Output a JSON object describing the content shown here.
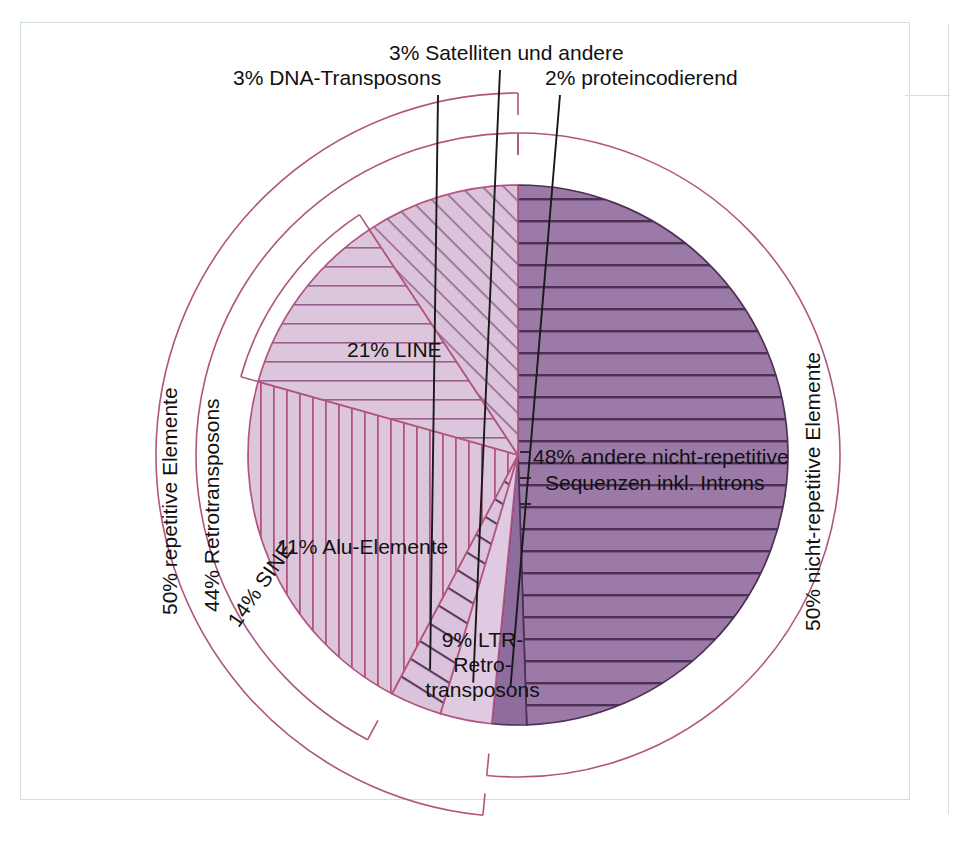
{
  "figure": {
    "frame_color": "#cfe0da",
    "outline_color": "#b1557f",
    "hatch_color": "#5a3a5e",
    "leader_color": "#1a1a1a"
  },
  "chart_data": {
    "type": "pie",
    "title": "",
    "xlabel": "",
    "ylabel": "",
    "legend_position": "none",
    "grid": false,
    "units": "percent",
    "total": 97,
    "start_angle_deg": 0,
    "direction": "clockwise",
    "categories": [
      "48% andere nicht-repetitive Sequenzen inkl. Introns",
      "2% proteincodierend",
      "3% Satelliten und andere",
      "3% DNA-Transposons",
      "21% LINE",
      "11% Alu-Elemente",
      "9% LTR-Retrotransposons"
    ],
    "values": [
      48,
      2,
      3,
      3,
      21,
      11,
      9
    ],
    "slices": [
      {
        "key": "nonrep",
        "label": "48% andere nicht-repetitive\nSequenzen inkl. Introns",
        "value": 48,
        "fill": "#9b7aa8",
        "pattern": "horizontal",
        "pattern_color": "#4e2f55"
      },
      {
        "key": "protein",
        "label": "2% proteincodierend",
        "value": 2,
        "fill": "#8e6c9e",
        "pattern": "solid",
        "pattern_color": "#4e2f55"
      },
      {
        "key": "satellite",
        "label": "3% Satelliten und andere",
        "value": 3,
        "fill": "#dfcae2",
        "pattern": "plain",
        "pattern_color": "#b1557f"
      },
      {
        "key": "dna",
        "label": "3% DNA-Transposons",
        "value": 3,
        "fill": "#dcc3dd",
        "pattern": "diagonal",
        "pattern_color": "#5a3a5e"
      },
      {
        "key": "line",
        "label": "21% LINE",
        "value": 21,
        "fill": "#dcc6dc",
        "pattern": "vertical",
        "pattern_color": "#b1557f"
      },
      {
        "key": "alu",
        "label": "11% Alu-Elemente",
        "value": 11,
        "fill": "#dcc6dc",
        "pattern": "horizontal",
        "pattern_color": "#b1557f"
      },
      {
        "key": "ltr",
        "label": "9% LTR-\nRetro-\ntransposons",
        "value": 9,
        "fill": "#dbc3dc",
        "pattern": "diagonal",
        "pattern_color": "#9a6a93"
      }
    ],
    "brackets": [
      {
        "key": "repetitive",
        "label": "50% repetitive Elemente",
        "value": 50,
        "covers": [
          "dna",
          "line",
          "alu",
          "ltr",
          "satellite"
        ]
      },
      {
        "key": "retro",
        "label": "44% Retrotransposons",
        "value": 44,
        "covers": [
          "line",
          "alu",
          "ltr"
        ]
      },
      {
        "key": "sine",
        "label": "14% SINE",
        "value": 14,
        "covers": [
          "alu"
        ]
      },
      {
        "key": "nonrepetitive",
        "label": "50% nicht-repetitive Elemente",
        "value": 50,
        "covers": [
          "nonrep",
          "protein"
        ]
      }
    ],
    "annotations": [
      {
        "key": "dna",
        "text": "3% DNA-Transposons"
      },
      {
        "key": "satellite",
        "text": "3% Satelliten und andere"
      },
      {
        "key": "protein",
        "text": "2% proteincodierend"
      }
    ]
  },
  "labels": {
    "dna_transposons": "3% DNA-Transposons",
    "satelliten": "3% Satelliten und andere",
    "proteincodierend": "2% proteincodierend",
    "line": "21% LINE",
    "alu": "11% Alu-Elemente",
    "ltr_l1": "9% LTR-",
    "ltr_l2": "Retro-",
    "ltr_l3": "transposons",
    "nonrep_l1": "48% andere nicht-repetitive",
    "nonrep_l2": "Sequenzen inkl. Introns",
    "repetitive": "50% repetitive Elemente",
    "retrotransposons": "44% Retrotransposons",
    "sine": "14% SINE",
    "nicht_repetitive": "50% nicht-repetitive Elemente"
  }
}
